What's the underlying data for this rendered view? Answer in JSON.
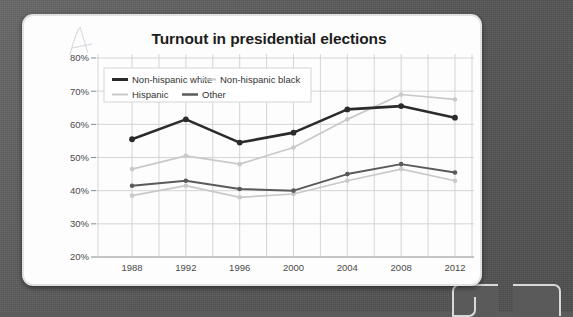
{
  "card": {
    "squiggle_name": "pencil-squiggle-artifact"
  },
  "chart_data": {
    "type": "line",
    "title": "Turnout in presidential elections",
    "xlabel": "",
    "ylabel": "",
    "categories": [
      "1988",
      "1992",
      "1996",
      "2000",
      "2004",
      "2008",
      "2012"
    ],
    "ylim": [
      20,
      80
    ],
    "ytick_labels": [
      "20%",
      "30%",
      "40%",
      "50%",
      "60%",
      "70%",
      "80%"
    ],
    "ytick_values": [
      20,
      30,
      40,
      50,
      60,
      70,
      80
    ],
    "grid": true,
    "legend_position": "top-left",
    "series": [
      {
        "name": "Non-hispanic white",
        "color": "#2b2b2b",
        "width": 2.6,
        "values": [
          55.5,
          61.5,
          54.5,
          57.5,
          64.5,
          65.5,
          62.0
        ]
      },
      {
        "name": "Non-hispanic black",
        "color": "#c9c9c9",
        "width": 1.7,
        "values": [
          46.5,
          50.5,
          48.0,
          53.0,
          61.5,
          69.0,
          67.5
        ]
      },
      {
        "name": "Hispanic",
        "color": "#c9c9c9",
        "width": 1.7,
        "values": [
          38.5,
          41.5,
          38.0,
          39.0,
          43.0,
          46.5,
          43.0
        ]
      },
      {
        "name": "Other",
        "color": "#5a5a5a",
        "width": 2.0,
        "values": [
          41.5,
          43.0,
          40.5,
          40.0,
          45.0,
          48.0,
          45.5
        ]
      }
    ]
  },
  "colors": {
    "card_background": "#fdfdfd",
    "backdrop": "#5b5b5b",
    "grid": "#d0d0d0",
    "axis": "#8a8a8a",
    "title": "#1d1d1d",
    "tick_label": "#4a4a4a"
  }
}
